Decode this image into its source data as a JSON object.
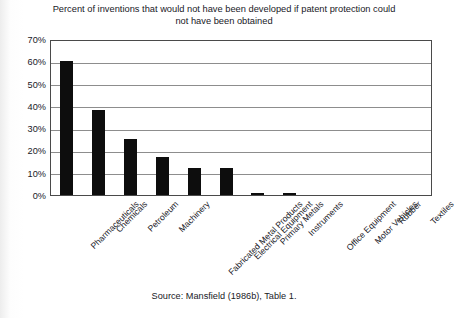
{
  "chart_data": {
    "type": "bar",
    "title": "Percent of inventions that would not have been developed if patent protection could not have been obtained",
    "title_line1": "Percent of inventions that would not have been developed if patent",
    "title_line2": "protection could not have been obtained",
    "xlabel": "",
    "ylabel": "",
    "ylim": [
      0,
      70
    ],
    "ytick_labels": [
      "70%",
      "60%",
      "50%",
      "40%",
      "30%",
      "20%",
      "10%",
      "0%"
    ],
    "ytick_values": [
      70,
      60,
      50,
      40,
      30,
      20,
      10,
      0
    ],
    "grid": true,
    "legend": "none",
    "bar_color": "#0d0d0d",
    "categories": [
      "Pharmaceuticals",
      "Chemicals",
      "Petroleum",
      "Machinery",
      "Fabricated Metal Products",
      "Electrical Equipment",
      "Primary Metals",
      "Instruments",
      "Office Equipment",
      "Motor Vehicles",
      "Rubber",
      "Textiles"
    ],
    "values": [
      60,
      38,
      25,
      17,
      12,
      12,
      1,
      1,
      0,
      0,
      0,
      0
    ],
    "annotations": [
      "Source: Mansfield (1986b), Table 1."
    ]
  },
  "source_note": "Source: Mansfield (1986b), Table 1."
}
